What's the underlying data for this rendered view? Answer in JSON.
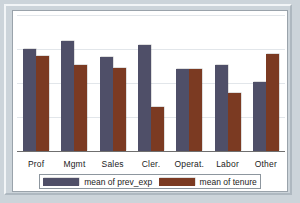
{
  "chart_data": {
    "type": "bar",
    "title": "",
    "xlabel": "",
    "ylabel": "",
    "grid": true,
    "legend_position": "bottom",
    "ylim": [
      0,
      100
    ],
    "categories": [
      "Prof",
      "Mgmt",
      "Sales",
      "Cler.",
      "Operat.",
      "Labor",
      "Other"
    ],
    "series": [
      {
        "name": "mean of prev_exp",
        "color": "#4f4f68",
        "values": [
          75,
          81,
          69,
          78,
          60,
          63,
          51
        ]
      },
      {
        "name": "mean of tenure",
        "color": "#7b3a22",
        "values": [
          70,
          63,
          61,
          32,
          60,
          43,
          71
        ]
      }
    ],
    "gridline_count": 5
  },
  "legend": {
    "items": [
      {
        "label": "mean of prev_exp",
        "color": "#4f4f68"
      },
      {
        "label": "mean of tenure",
        "color": "#7b3a22"
      }
    ]
  },
  "colors": {
    "prev_exp": "#4f4f68",
    "tenure": "#7b3a22",
    "page_background": "#ccd4da",
    "chart_background": "#ffffff",
    "gridline": "#e2e6ea",
    "axis": "#6f6f6f"
  }
}
